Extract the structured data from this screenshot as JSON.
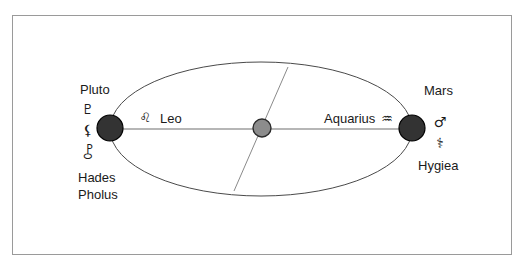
{
  "figure": {
    "background_color": "#ffffff",
    "border_color": "#9a9a9a",
    "body_fill_color": "#333333",
    "body_stroke_color": "#000000",
    "center_fill_color": "#8c8c8c",
    "center_stroke_color": "#2b2b2b",
    "orbit_stroke_color": "#4a4a4a",
    "axis_stroke_color": "#6e6e6e",
    "diagonal_stroke_color": "#8a8a8a",
    "text_color": "#1a1a1a"
  },
  "left_body": {
    "name": "Pluto",
    "symbols": [
      {
        "key": "pluto-glyph",
        "char": "♇",
        "title": "Pluto"
      },
      {
        "key": "hades-glyph",
        "char": "⚸",
        "title": "Hades"
      },
      {
        "key": "pholus-glyph",
        "char": "⯛",
        "title": "Pholus"
      }
    ],
    "extra_labels": [
      "Hades",
      "Pholus"
    ],
    "sign": {
      "name": "Leo",
      "glyph": "♌"
    }
  },
  "right_body": {
    "name": "Mars",
    "symbols": [
      {
        "key": "mars-glyph",
        "char": "♂",
        "title": "Mars"
      },
      {
        "key": "hygiea-glyph",
        "char": "⚕",
        "title": "Hygiea"
      }
    ],
    "extra_labels": [
      "Hygiea"
    ],
    "sign": {
      "name": "Aquarius",
      "glyph": "♒"
    }
  },
  "center_body": {
    "name": "center-node"
  },
  "geometry": {
    "border": {
      "x": 12,
      "y": 15,
      "width": 500,
      "height": 240
    },
    "ellipse": {
      "cx": 261,
      "cy": 129,
      "rx": 151,
      "ry": 67
    },
    "axis": {
      "x1": 110,
      "y1": 129,
      "x2": 412,
      "y2": 129
    },
    "diagonal": {
      "x1": 288,
      "y1": 67,
      "x2": 234,
      "y2": 191
    },
    "left_circle": {
      "cx": 110,
      "cy": 128,
      "r": 13
    },
    "right_circle": {
      "cx": 412,
      "cy": 128,
      "r": 13
    },
    "center_circle": {
      "cx": 262,
      "cy": 128,
      "r": 9
    }
  }
}
